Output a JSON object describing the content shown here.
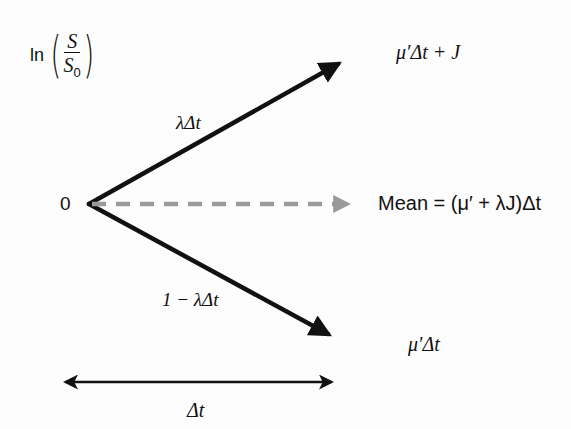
{
  "diagram": {
    "y_axis_label": {
      "prefix": "ln",
      "numerator": "S",
      "denominator": "S",
      "denominator_subscript": "0"
    },
    "origin_label": "0",
    "branches": [
      {
        "id": "jump-branch",
        "probability_label": "λΔt",
        "endpoint_label": "μ′Δt + J",
        "style": "solid-black-arrow"
      },
      {
        "id": "mean-line",
        "endpoint_label": "Mean = (μ′ + λJ)Δt",
        "style": "dashed-gray-arrow"
      },
      {
        "id": "no-jump-branch",
        "probability_label": "1 − λΔt",
        "endpoint_label": "μ′Δt",
        "style": "solid-black-arrow"
      }
    ],
    "time_span": {
      "label": "Δt",
      "style": "double-headed-arrow"
    },
    "colors": {
      "solid_arrow": "#111111",
      "dashed_arrow": "#9a9a9a",
      "text": "#111111",
      "background": "#fdfdfd"
    }
  }
}
